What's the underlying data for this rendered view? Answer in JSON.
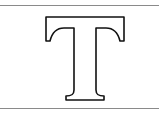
{
  "glyph": {
    "character": "T",
    "icon": "letter-t-outline-icon",
    "style": "outlined serif capital",
    "stroke_color": "#111111",
    "fill_color": "#ffffff"
  },
  "frame": {
    "rule_color": "#8a8a8a"
  }
}
